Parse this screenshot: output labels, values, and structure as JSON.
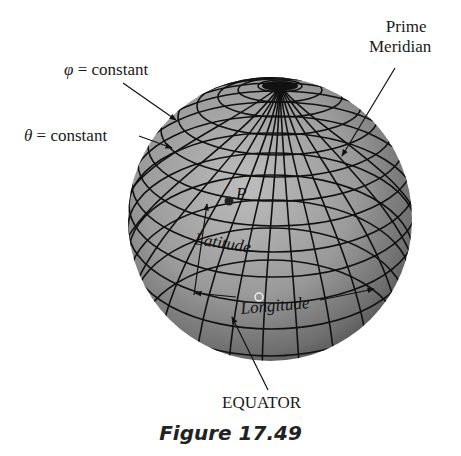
{
  "figure": {
    "caption": "Figure 17.49",
    "labels": {
      "phi_symbol": "φ",
      "phi_rest": " = constant",
      "theta_symbol": "θ",
      "theta_rest": " = constant",
      "prime_line1": "Prime",
      "prime_line2": "Meridian",
      "point": "P",
      "latitude": "Latitude",
      "longitude": "Longitude",
      "equator": "EQUATOR"
    },
    "colors": {
      "sphere_light": "#b4b4b4",
      "sphere_dark": "#555555",
      "grid": "#111111",
      "text": "#1a1a1a"
    }
  }
}
